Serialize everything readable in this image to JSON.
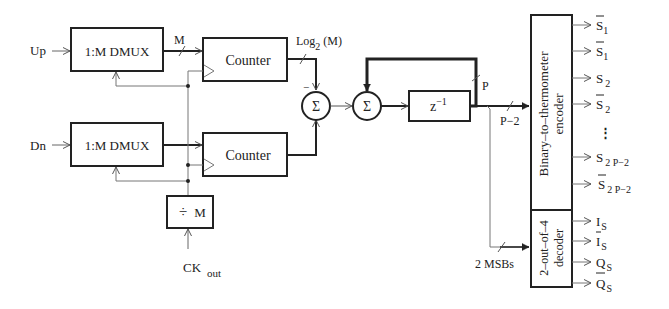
{
  "diagram": {
    "inputs": {
      "up": "Up",
      "dn": "Dn",
      "clock": "CK",
      "clock_sub": "out"
    },
    "blocks": {
      "dmux_up": "1:M DMUX",
      "dmux_dn": "1:M DMUX",
      "counter_up": "Counter",
      "counter_dn": "Counter",
      "divider_symbol": "÷",
      "divider_M": "M",
      "sum1": "Σ",
      "sum2": "Σ",
      "delay": "z",
      "delay_exp": "−1",
      "encoder_line1": "Binary–to–thermometer",
      "encoder_line2": "encoder",
      "decoder_line1": "2–out–of–4",
      "decoder_line2": "decoder"
    },
    "bus_labels": {
      "dmux_width": "M",
      "counter_width_pre": "Log",
      "counter_width_sub": "2",
      "counter_width_post": " (M)",
      "feedback_width": "P",
      "encoder_width": "P−2",
      "msbs": "2 MSBs"
    },
    "sign": "−",
    "encoder_outputs": [
      {
        "base": "S",
        "sub": "1",
        "bar": true
      },
      {
        "base": "S",
        "sub": "1",
        "bar": true
      },
      {
        "base": "S",
        "sub": "2",
        "bar": false
      },
      {
        "base": "S",
        "sub": "2",
        "bar": true
      },
      {
        "ellipsis": "⋮"
      },
      {
        "base": "S",
        "sub": "2 P−2",
        "bar": false
      },
      {
        "base": "S",
        "sub": "2 P−2",
        "bar": true
      }
    ],
    "decoder_outputs": [
      {
        "base": "I",
        "sub": "S",
        "bar": false
      },
      {
        "base": "I",
        "sub": "S",
        "bar": true
      },
      {
        "base": "Q",
        "sub": "S",
        "bar": false
      },
      {
        "base": "Q",
        "sub": "S",
        "bar": true
      }
    ],
    "colors": {
      "line": "#222222",
      "thin_line": "#777777",
      "background": "#ffffff"
    }
  }
}
